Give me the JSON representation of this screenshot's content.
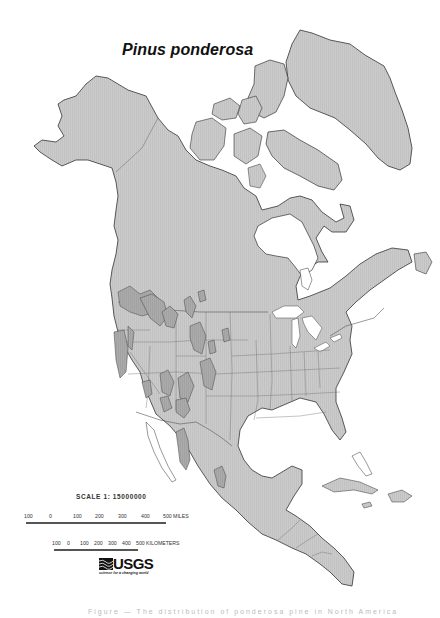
{
  "map": {
    "title": "Pinus ponderosa",
    "region": "North America",
    "colors": {
      "land": "#c9c9c9",
      "range": "#a9a9a9",
      "border": "#6a6a6a",
      "water": "#ffffff",
      "coast": "#3a3a3a"
    }
  },
  "scale": {
    "label": "SCALE 1: 15000000",
    "miles": {
      "ticks": [
        "100",
        "0",
        "100",
        "200",
        "300",
        "400",
        "500 MILES"
      ]
    },
    "kilometers": {
      "ticks": [
        "100",
        "0",
        "100",
        "200",
        "300",
        "400",
        "500 KILOMETERS"
      ]
    }
  },
  "logo": {
    "name": "USGS",
    "tagline": "science for a changing world"
  },
  "caption": {
    "text": "Figure — The distribution of ponderosa pine in North America"
  }
}
